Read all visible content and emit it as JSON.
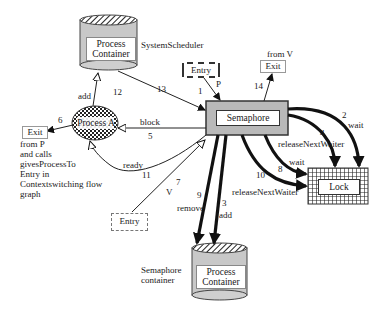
{
  "diagram": {
    "nodes": {
      "system_scheduler_container": {
        "label_line1": "Process",
        "label_line2": "Container",
        "caption": "SystemScheduler"
      },
      "semaphore_container": {
        "label_line1": "Process",
        "label_line2": "Container",
        "caption_line1": "Semaphore",
        "caption_line2": "container"
      },
      "process_a": {
        "label": "Process A"
      },
      "semaphore": {
        "label": "Semaphore"
      },
      "lock": {
        "label": "Lock"
      },
      "entry_p": {
        "label": "Entry"
      },
      "entry_v": {
        "label": "Entry"
      },
      "exit_p": {
        "label": "Exit"
      },
      "exit_v": {
        "label": "Exit",
        "caption": "from V"
      }
    },
    "exit_p_note": [
      "from P",
      "and calls",
      "givesProcessTo",
      "Entry in",
      "Contextswitching flow",
      "graph"
    ],
    "edges": [
      {
        "num": "1",
        "label": "P",
        "from": "Entry",
        "to": "Semaphore"
      },
      {
        "num": "2",
        "label": "wait",
        "from": "Semaphore",
        "to": "Lock"
      },
      {
        "num": "3",
        "label": "add",
        "from": "Semaphore",
        "to": "Semaphore container"
      },
      {
        "num": "4",
        "label": "releaseNextWaiter",
        "from": "Semaphore",
        "to": "Lock"
      },
      {
        "num": "5",
        "label": "block",
        "from": "Semaphore",
        "to": "Process A"
      },
      {
        "num": "6",
        "label": "",
        "from": "Process A",
        "to": "Exit"
      },
      {
        "num": "7",
        "label": "V",
        "from": "Entry",
        "to": "Semaphore"
      },
      {
        "num": "8",
        "label": "wait",
        "from": "Semaphore",
        "to": "Lock"
      },
      {
        "num": "9",
        "label": "remove",
        "from": "Semaphore",
        "to": "Semaphore container"
      },
      {
        "num": "10",
        "label": "releaseNextWaiter",
        "from": "Semaphore",
        "to": "Lock"
      },
      {
        "num": "11",
        "label": "ready",
        "from": "Semaphore",
        "to": "Process A"
      },
      {
        "num": "12",
        "label": "add",
        "from": "Process A",
        "to": "SystemScheduler container"
      },
      {
        "num": "13",
        "label": "",
        "from": "SystemScheduler container",
        "to": "Semaphore"
      },
      {
        "num": "14",
        "label": "",
        "from": "Semaphore",
        "to": "Exit"
      }
    ]
  }
}
